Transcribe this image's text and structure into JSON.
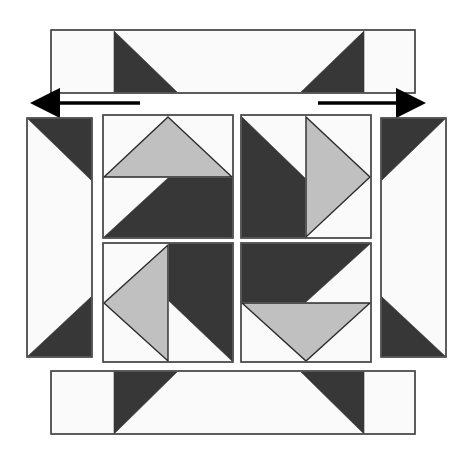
{
  "figure": {
    "canvas": {
      "width": 466,
      "height": 459
    },
    "background_color": "#ffffff"
  },
  "palette": {
    "dark": "#373737",
    "medium_gray": "#c0c0c0",
    "light": "#fafafa",
    "outline": "#4d4d4d",
    "arrow": "#000000"
  },
  "annotations": {
    "arrow_left": {
      "name": "left-pointing-arrow",
      "direction": "left",
      "x_start": 140,
      "x_end": 52,
      "y": 103
    },
    "arrow_right": {
      "name": "right-pointing-arrow",
      "direction": "right",
      "x_start": 318,
      "x_end": 404,
      "y": 103
    }
  },
  "pieces": {
    "top_sash": {
      "label": "Top sashing strip",
      "rect": {
        "x": 51,
        "y": 30,
        "w": 364,
        "h": 63
      },
      "dark_triangles": [
        {
          "label": "left dark triangle",
          "points": "114,31 114,92 177,92"
        },
        {
          "label": "right dark triangle",
          "points": "364,31 364,92 301,92"
        }
      ]
    },
    "bottom_sash": {
      "label": "Bottom sashing strip",
      "rect": {
        "x": 51,
        "y": 371,
        "w": 364,
        "h": 63
      },
      "dark_triangles": [
        {
          "label": "left dark triangle",
          "points": "114,434 114,372 177,372"
        },
        {
          "label": "right dark triangle",
          "points": "364,434 364,372 301,372"
        }
      ]
    },
    "left_sash": {
      "label": "Left sashing strip",
      "rect": {
        "x": 27,
        "y": 118,
        "w": 65,
        "h": 239
      },
      "dark_triangles": [
        {
          "label": "top dark triangle",
          "points": "28,119 91,119 91,180"
        },
        {
          "label": "bottom dark triangle",
          "points": "28,356 91,356 91,297"
        }
      ]
    },
    "right_sash": {
      "label": "Right sashing strip",
      "rect": {
        "x": 381,
        "y": 118,
        "w": 65,
        "h": 239
      },
      "dark_triangles": [
        {
          "label": "top dark triangle",
          "points": "445,119 382,119 382,180"
        },
        {
          "label": "bottom dark triangle",
          "points": "445,356 382,356 382,297"
        }
      ]
    },
    "block_top_left": {
      "label": "Top-left quilt block",
      "rect": {
        "x": 103,
        "y": 115,
        "w": 130,
        "h": 123
      },
      "shapes": [
        {
          "label": "gray peak triangle",
          "fill": "medium_gray",
          "points": "168,117 232,177 104,177"
        },
        {
          "label": "dark right triangle",
          "fill": "dark",
          "points": "168,178 232,178 232,237 104,237"
        }
      ]
    },
    "block_top_right": {
      "label": "Top-right quilt block",
      "rect": {
        "x": 241,
        "y": 115,
        "w": 130,
        "h": 123
      },
      "shapes": [
        {
          "label": "dark wedge",
          "fill": "dark",
          "points": "242,117 305,178 305,237 242,237"
        },
        {
          "label": "gray right-pointing triangle",
          "fill": "medium_gray",
          "points": "306,117 370,177 306,237"
        }
      ]
    },
    "block_bottom_left": {
      "label": "Bottom-left quilt block",
      "rect": {
        "x": 103,
        "y": 243,
        "w": 130,
        "h": 119
      },
      "shapes": [
        {
          "label": "dark wedge",
          "fill": "dark",
          "points": "169,244 232,244 232,361 169,301"
        },
        {
          "label": "gray left-pointing triangle",
          "fill": "medium_gray",
          "points": "168,245 168,361 104,303"
        }
      ]
    },
    "block_bottom_right": {
      "label": "Bottom-right quilt block",
      "rect": {
        "x": 241,
        "y": 243,
        "w": 130,
        "h": 119
      },
      "shapes": [
        {
          "label": "dark wedge",
          "fill": "dark",
          "points": "242,244 370,244 306,302 242,302"
        },
        {
          "label": "gray down-pointing triangle",
          "fill": "medium_gray",
          "points": "242,303 370,303 306,361"
        }
      ]
    }
  }
}
